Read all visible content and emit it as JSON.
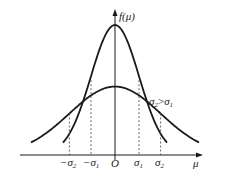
{
  "diagram": {
    "y_axis_label": "f(μ)",
    "x_axis_label": "μ",
    "origin_label": "O",
    "x_tick_labels": [
      {
        "key": "neg_sigma2",
        "base": "−σ",
        "sub": "2"
      },
      {
        "key": "neg_sigma1",
        "base": "−σ",
        "sub": "1"
      },
      {
        "key": "sigma1",
        "base": "σ",
        "sub": "1"
      },
      {
        "key": "sigma2",
        "base": "σ",
        "sub": "2"
      }
    ],
    "annotation": {
      "left": "σ",
      "left_sub": "2",
      "op": ">",
      "right": "σ",
      "right_sub": "1"
    },
    "curves": [
      {
        "name": "narrow",
        "sigma": "σ1",
        "relative_sigma": 1.0
      },
      {
        "name": "wide",
        "sigma": "σ2",
        "relative_sigma": 1.9
      }
    ],
    "line_color": "#1a1a1a"
  }
}
